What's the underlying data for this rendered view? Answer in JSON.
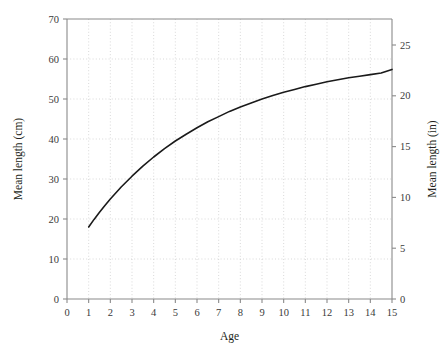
{
  "chart_data": {
    "type": "line",
    "title": "",
    "xlabel": "Age",
    "ylabel": "Mean length (cm)",
    "ylabel_right": "Mean length (in)",
    "xlim": [
      0,
      15
    ],
    "ylim": [
      0,
      70
    ],
    "ylim_right": [
      0,
      27.56
    ],
    "grid": true,
    "grid_style": "dotted",
    "legend": "none",
    "xticks": [
      0,
      1,
      2,
      3,
      4,
      5,
      6,
      7,
      8,
      9,
      10,
      11,
      12,
      13,
      14,
      15
    ],
    "xtick_labels": [
      "0",
      "1",
      "2",
      "3",
      "4",
      "5",
      "6",
      "7",
      "8",
      "9",
      "10",
      "11",
      "12",
      "13",
      "14",
      "15"
    ],
    "yticks": [
      0,
      10,
      20,
      30,
      40,
      50,
      60,
      70
    ],
    "ytick_labels": [
      "0",
      "10",
      "20",
      "30",
      "40",
      "50",
      "60",
      "70"
    ],
    "yticks_right": [
      0,
      5,
      10,
      15,
      20,
      25
    ],
    "ytick_labels_right": [
      "0",
      "5",
      "10",
      "15",
      "20",
      "25"
    ],
    "series": [
      {
        "name": "Mean length at age",
        "color": "#1a1a1a",
        "x": [
          1.0,
          1.25,
          1.5,
          1.75,
          2.0,
          2.5,
          3.0,
          3.5,
          4.0,
          4.5,
          5.0,
          5.5,
          6.0,
          6.5,
          7.0,
          7.5,
          8.0,
          8.5,
          9.0,
          9.5,
          10.0,
          10.5,
          11.0,
          11.5,
          12.0,
          12.5,
          13.0,
          13.5,
          14.0,
          14.5,
          15.0
        ],
        "values": [
          18.0,
          19.9,
          21.7,
          23.4,
          25.0,
          28.0,
          30.7,
          33.2,
          35.5,
          37.6,
          39.5,
          41.2,
          42.8,
          44.3,
          45.6,
          46.9,
          48.0,
          49.0,
          50.0,
          50.9,
          51.7,
          52.4,
          53.1,
          53.7,
          54.3,
          54.8,
          55.3,
          55.7,
          56.1,
          56.5,
          57.4
        ]
      }
    ]
  },
  "axes": {
    "left_title": "Mean length (cm)",
    "right_title": "Mean length (in)",
    "bottom_title": "Age"
  }
}
